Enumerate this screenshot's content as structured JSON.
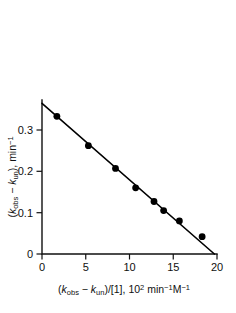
{
  "chart_data": {
    "type": "scatter",
    "title": "",
    "subtitle": "",
    "xlabel": "(kobs − kun)/[1], 10² min⁻¹ M⁻¹",
    "ylabel": "(kobs − kun), min⁻¹",
    "xlim": [
      0,
      20
    ],
    "ylim": [
      0,
      0.355
    ],
    "xticks": [
      0,
      5,
      10,
      15,
      20
    ],
    "xtick_labels": [
      "0",
      "5",
      "10",
      "15",
      "20"
    ],
    "yticks": [
      0,
      0.1,
      0.2,
      0.3
    ],
    "ytick_labels": [
      "0",
      "0.1",
      "0.2",
      "0.3"
    ],
    "grid": false,
    "legend": "none",
    "marker": "filled-circle",
    "marker_color": "#000000",
    "line_color": "#000000",
    "points": [
      {
        "x": 1.7,
        "y": 0.333
      },
      {
        "x": 5.3,
        "y": 0.262
      },
      {
        "x": 8.4,
        "y": 0.207
      },
      {
        "x": 10.7,
        "y": 0.16
      },
      {
        "x": 12.8,
        "y": 0.127
      },
      {
        "x": 13.9,
        "y": 0.105
      },
      {
        "x": 15.7,
        "y": 0.08
      },
      {
        "x": 18.3,
        "y": 0.042
      }
    ],
    "series": [
      {
        "name": "data",
        "x": [
          1.7,
          5.3,
          8.4,
          10.7,
          12.8,
          13.9,
          15.7,
          18.3
        ],
        "values": [
          0.333,
          0.262,
          0.207,
          0.16,
          0.127,
          0.105,
          0.08,
          0.042
        ]
      },
      {
        "name": "linear fit",
        "type": "line",
        "x": [
          0,
          19.7
        ],
        "values": [
          0.3645,
          0.0
        ]
      }
    ],
    "fit": {
      "intercept": 0.3645,
      "x_intercept": 19.7,
      "slope": -0.0185
    },
    "axis_label_parts": {
      "y": {
        "open": "(",
        "k1": "k",
        "k1_sub": "obs",
        "minus": " − ",
        "k2": "k",
        "k2_sub": "un",
        "close": "), min",
        "exp": "−1"
      },
      "x": {
        "open": "(",
        "k1": "k",
        "k1_sub": "obs",
        "minus": " − ",
        "k2": "k",
        "k2_sub": "un",
        "close": ")/[1], 10",
        "exp1": "2",
        "unit1": " min",
        "exp2": "−1",
        "unit2": "M",
        "exp3": "−1"
      }
    }
  }
}
